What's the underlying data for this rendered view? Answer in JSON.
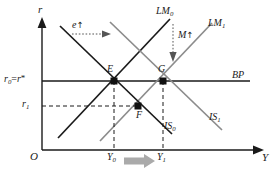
{
  "figure": {
    "type": "is-lm-bp-diagram",
    "title": "",
    "colors": {
      "axis": "#1a1a1a",
      "dark_curve": "#1a1a1a",
      "gray_curve": "#8c8c8c",
      "bp_line": "#1a1a1a",
      "dashed": "#1a1a1a",
      "shift_arrow": "#9e9e9e",
      "text": "#1a1a1a"
    }
  },
  "axes": {
    "y_axis_label": "r",
    "x_axis_label": "Y",
    "origin_label": "O"
  },
  "value_labels": {
    "r0": "r",
    "r0_sub": "0",
    "r0_eq": "=",
    "r0_star_base": "r",
    "r0_star": "*",
    "r1": "r",
    "r1_sub": "1",
    "Y0": "Y",
    "Y0_sub": "0",
    "Y1": "Y",
    "Y1_sub": "1"
  },
  "curves": [
    {
      "name": "LM0",
      "base": "LM",
      "sub": "0",
      "color": "#1a1a1a",
      "slope": "upward",
      "style": "solid"
    },
    {
      "name": "LM1",
      "base": "LM",
      "sub": "1",
      "color": "#8c8c8c",
      "slope": "upward",
      "style": "solid"
    },
    {
      "name": "IS0",
      "base": "IS",
      "sub": "0",
      "color": "#1a1a1a",
      "slope": "downward",
      "style": "solid"
    },
    {
      "name": "IS1",
      "base": "IS",
      "sub": "1",
      "color": "#8c8c8c",
      "slope": "downward",
      "style": "solid"
    },
    {
      "name": "BP",
      "base": "BP",
      "sub": "",
      "color": "#1a1a1a",
      "slope": "horizontal",
      "style": "solid"
    }
  ],
  "points": [
    {
      "name": "E",
      "label": "E",
      "x": 114,
      "y": 81
    },
    {
      "name": "G",
      "label": "G",
      "x": 163,
      "y": 81
    },
    {
      "name": "F",
      "label": "F",
      "x": 138,
      "y": 106
    }
  ],
  "annotations": [
    {
      "name": "exchange-rate-shift",
      "base": "e",
      "arrow": "↑",
      "direction": "right",
      "style": "dotted"
    },
    {
      "name": "money-supply-shift",
      "base": "M",
      "arrow": "↑",
      "direction": "down",
      "style": "dotted"
    },
    {
      "name": "output-expansion",
      "base": "",
      "arrow": "",
      "direction": "right",
      "style": "thick-gray"
    }
  ]
}
